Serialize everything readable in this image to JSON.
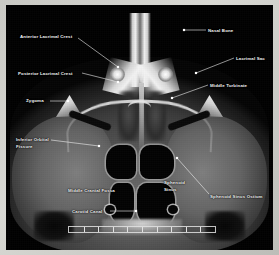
{
  "image": {
    "modality": "CT",
    "plane": "axial",
    "region": "skull base / midface",
    "description": "Annotated axial CT scan of the skull base showing nasal, orbital, sphenoid and temporal bone anatomy"
  },
  "frame": {
    "border_color": "#c9c9c4",
    "background_color": "#010101"
  },
  "annotations": [
    {
      "id": "anterior-lacrimal-crest",
      "label": "Anterior Lacrimal Crest",
      "lines": [
        "Anterior Lacrimal Crest"
      ],
      "label_x": 14,
      "label_y": 29,
      "align": "left",
      "line_from_x": 72,
      "line_from_y": 33,
      "line_to_x": 112,
      "line_to_y": 62,
      "marker_x": 112,
      "marker_y": 62
    },
    {
      "id": "posterior-lacrimal-crest",
      "label": "Posterior Lacrimal Crest",
      "lines": [
        "Posterior Lacrimal Crest"
      ],
      "label_x": 12,
      "label_y": 66,
      "align": "left",
      "line_from_x": 76,
      "line_from_y": 68,
      "line_to_x": 112,
      "line_to_y": 77,
      "marker_x": 112,
      "marker_y": 77
    },
    {
      "id": "zygoma",
      "label": "Zygoma",
      "lines": [
        "Zygoma"
      ],
      "label_x": 20,
      "label_y": 93,
      "align": "left",
      "line_from_x": 44,
      "line_from_y": 96,
      "line_to_x": 62,
      "line_to_y": 96,
      "marker_x": 62,
      "marker_y": 96
    },
    {
      "id": "inferior-orbital-fissure",
      "label": "Inferior Orbital Fissure",
      "lines": [
        "Inferior Orbital",
        "Fissure"
      ],
      "label_x": 10,
      "label_y": 132,
      "align": "left",
      "line_from_x": 45,
      "line_from_y": 135,
      "line_to_x": 93,
      "line_to_y": 141,
      "marker_x": 93,
      "marker_y": 141
    },
    {
      "id": "middle-cranial-fossa",
      "label": "Middle Cranial Fossa",
      "lines": [
        "Middle Cranial Fossa"
      ],
      "label_x": 62,
      "label_y": 183,
      "align": "left",
      "line_from_x": 0,
      "line_from_y": 0,
      "line_to_x": 0,
      "line_to_y": 0,
      "marker_x": 0,
      "marker_y": 0
    },
    {
      "id": "carotid-canal",
      "label": "Carotid Canal",
      "lines": [
        "Carotid Canal"
      ],
      "label_x": 66,
      "label_y": 204,
      "align": "left",
      "line_from_x": 104,
      "line_from_y": 206,
      "line_to_x": 130,
      "line_to_y": 206,
      "marker_x": 130,
      "marker_y": 206
    },
    {
      "id": "sphenoid-sinus",
      "label": "Sphenoid Sinus",
      "lines": [
        "Sphenoid",
        "Sinus"
      ],
      "label_x": 158,
      "label_y": 175,
      "align": "left",
      "line_from_x": 0,
      "line_from_y": 0,
      "line_to_x": 0,
      "line_to_y": 0,
      "marker_x": 0,
      "marker_y": 0
    },
    {
      "id": "sphenoid-sinus-ostium",
      "label": "Sphenoid Sinus Ostium",
      "lines": [
        "Sphenoid Sinus Ostium"
      ],
      "label_x": 204,
      "label_y": 189,
      "align": "left",
      "line_from_x": 203,
      "line_from_y": 189,
      "line_to_x": 171,
      "line_to_y": 153,
      "marker_x": 171,
      "marker_y": 153
    },
    {
      "id": "nasal-bone",
      "label": "Nasal Bone",
      "lines": [
        "Nasal Bone"
      ],
      "label_x": 202,
      "label_y": 23,
      "align": "left",
      "line_from_x": 200,
      "line_from_y": 25,
      "line_to_x": 178,
      "line_to_y": 25,
      "marker_x": 178,
      "marker_y": 25
    },
    {
      "id": "lacrimal-sac",
      "label": "Lacrimal Sac",
      "lines": [
        "Lacrimal Sac"
      ],
      "label_x": 230,
      "label_y": 51,
      "align": "left",
      "line_from_x": 228,
      "line_from_y": 53,
      "line_to_x": 190,
      "line_to_y": 68,
      "marker_x": 190,
      "marker_y": 68
    },
    {
      "id": "middle-turbinate",
      "label": "Middle Turbinate",
      "lines": [
        "Middle Turbinate"
      ],
      "label_x": 204,
      "label_y": 78,
      "align": "left",
      "line_from_x": 202,
      "line_from_y": 80,
      "line_to_x": 166,
      "line_to_y": 93,
      "marker_x": 166,
      "marker_y": 93
    }
  ],
  "scalebar": {
    "present": true,
    "tick_count": 10,
    "color": "#e2e2e2"
  }
}
